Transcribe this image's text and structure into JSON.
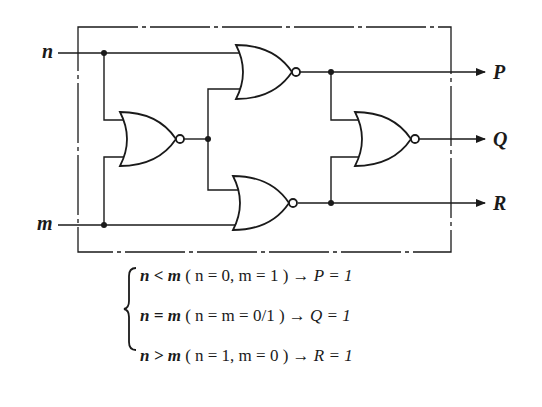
{
  "diagram": {
    "type": "logic-circuit",
    "inputs": [
      {
        "id": "n",
        "label": "n"
      },
      {
        "id": "m",
        "label": "m"
      }
    ],
    "outputs": [
      {
        "id": "P",
        "label": "P"
      },
      {
        "id": "Q",
        "label": "Q"
      },
      {
        "id": "R",
        "label": "R"
      }
    ],
    "gates": [
      {
        "id": "g1",
        "type": "NOR",
        "inputs": [
          "n",
          "m"
        ],
        "output": "x"
      },
      {
        "id": "g2",
        "type": "NOR",
        "inputs": [
          "n",
          "x"
        ],
        "output": "P"
      },
      {
        "id": "g3",
        "type": "NOR",
        "inputs": [
          "x",
          "m"
        ],
        "output": "R"
      },
      {
        "id": "g4",
        "type": "NOR",
        "inputs": [
          "P",
          "R"
        ],
        "output": "Q"
      }
    ],
    "colors": {
      "ink": "#1a1a1a",
      "background": "#ffffff"
    }
  },
  "equations": {
    "brace": "{",
    "lines": [
      {
        "condition": "n < m",
        "detail": "( n = 0, m = 1 )",
        "arrow": "→",
        "result": "P = 1"
      },
      {
        "condition": "n = m",
        "detail": "( n = m = 0/1 )",
        "arrow": "→",
        "result": "Q = 1"
      },
      {
        "condition": "n > m",
        "detail": "( n = 1, m = 0 )",
        "arrow": "→",
        "result": "R = 1"
      }
    ]
  }
}
